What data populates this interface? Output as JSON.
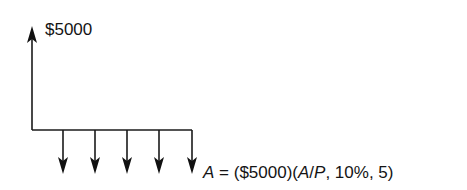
{
  "diagram": {
    "type": "cash-flow-diagram",
    "receipt": {
      "label": "$5000",
      "period": 0,
      "direction": "up"
    },
    "payments": {
      "count": 5,
      "periods": [
        1,
        2,
        3,
        4,
        5
      ],
      "direction": "down"
    },
    "equation": {
      "lhs": "A",
      "equals": " = ",
      "principal": "($5000)",
      "factor_open": "(",
      "factor_a": "A",
      "factor_slash": "/",
      "factor_p": "P",
      "factor_rest": ", 10%, 5)"
    },
    "line_color": "#1a1a1a"
  }
}
